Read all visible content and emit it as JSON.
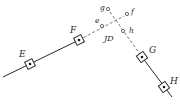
{
  "diagram": {
    "colors": {
      "line": "#2a2a2a",
      "dashed": "#6a6a6a",
      "background": "#ffffff"
    },
    "stations": [
      {
        "id": "E",
        "label": "E",
        "x": 30,
        "y": 64,
        "label_x": 19,
        "label_y": 57
      },
      {
        "id": "F",
        "label": "F",
        "x": 79,
        "y": 40,
        "label_x": 70,
        "label_y": 33
      },
      {
        "id": "G",
        "label": "G",
        "x": 142,
        "y": 57,
        "label_x": 149,
        "label_y": 53
      },
      {
        "id": "H",
        "label": "H",
        "x": 164,
        "y": 87,
        "label_x": 170,
        "label_y": 84
      }
    ],
    "auxiliary_points": [
      {
        "id": "e",
        "label": "e",
        "x": 102,
        "y": 26,
        "label_x": 95,
        "label_y": 23
      },
      {
        "id": "f",
        "label": "f",
        "x": 127,
        "y": 14,
        "label_x": 131,
        "label_y": 14
      },
      {
        "id": "g",
        "label": "g",
        "x": 108,
        "y": 9,
        "label_x": 100,
        "label_y": 10
      },
      {
        "id": "h",
        "label": "h",
        "x": 123,
        "y": 31,
        "label_x": 129,
        "label_y": 33
      }
    ],
    "intersection": {
      "label": "JD",
      "x": 115,
      "y": 20,
      "label_x": 104,
      "label_y": 41
    }
  }
}
